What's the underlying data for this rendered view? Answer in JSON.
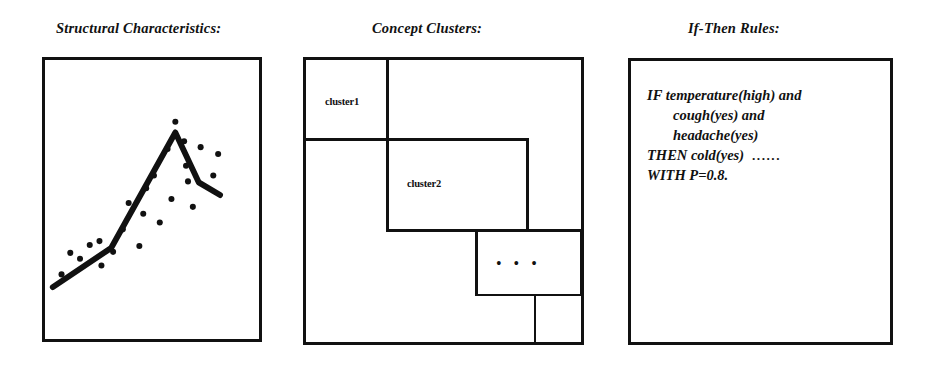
{
  "figure": {
    "panels": [
      {
        "id": "structural",
        "title": "Structural Characteristics:",
        "type": "scatter-with-trendline"
      },
      {
        "id": "clusters",
        "title": "Concept Clusters:",
        "type": "nested-cluster-boxes",
        "labels": {
          "cluster1": "cluster1",
          "cluster2": "cluster2",
          "more": "• • •"
        }
      },
      {
        "id": "rules",
        "title": "If-Then Rules:",
        "type": "rule-text",
        "rule_lines": [
          "IF  temperature(high) and",
          "cough(yes) and",
          "headache(yes)",
          "THEN  cold(yes)",
          "WITH  P=0.8."
        ],
        "ellipsis": "······"
      }
    ],
    "colors": {
      "ink": "#111111",
      "paper": "#ffffff"
    }
  },
  "chart_data": {
    "type": "scatter",
    "title": "Structural Characteristics:",
    "xlabel": "",
    "ylabel": "",
    "xlim": [
      0,
      220
    ],
    "ylim": [
      0,
      285
    ],
    "grid": false,
    "legend": null,
    "points": [
      [
        17,
        219
      ],
      [
        26,
        197
      ],
      [
        36,
        203
      ],
      [
        46,
        189
      ],
      [
        56,
        185
      ],
      [
        58,
        210
      ],
      [
        70,
        196
      ],
      [
        80,
        173
      ],
      [
        86,
        146
      ],
      [
        97,
        190
      ],
      [
        101,
        157
      ],
      [
        104,
        131
      ],
      [
        112,
        118
      ],
      [
        118,
        166
      ],
      [
        126,
        91
      ],
      [
        130,
        142
      ],
      [
        134,
        63
      ],
      [
        143,
        83
      ],
      [
        145,
        108
      ],
      [
        147,
        124
      ],
      [
        152,
        150
      ],
      [
        160,
        89
      ],
      [
        173,
        118
      ],
      [
        178,
        96
      ]
    ],
    "trendline": [
      [
        8,
        232
      ],
      [
        68,
        192
      ],
      [
        134,
        74
      ],
      [
        158,
        125
      ],
      [
        180,
        138
      ]
    ]
  }
}
